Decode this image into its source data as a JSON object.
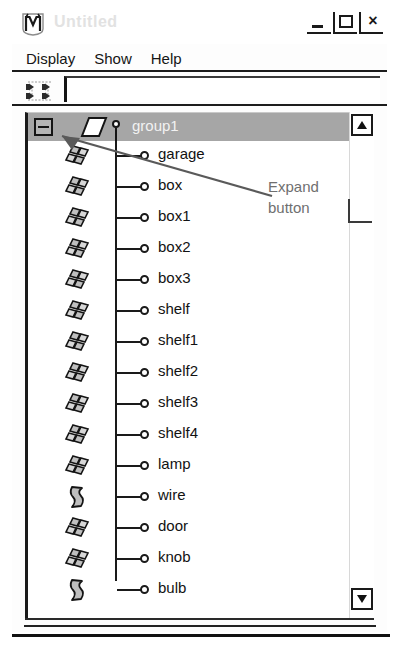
{
  "window": {
    "title": "Untitled",
    "app_icon": "m-logo-icon",
    "controls": [
      {
        "name": "minimize",
        "glyph": "_"
      },
      {
        "name": "maximize",
        "glyph": "square"
      },
      {
        "name": "close",
        "glyph": "×"
      }
    ]
  },
  "menu": {
    "items": [
      {
        "label": "Display"
      },
      {
        "label": "Show"
      },
      {
        "label": "Help"
      }
    ]
  },
  "toolbar": {
    "hierarchy_icon": "hierarchy-nodes-icon",
    "path_field": {
      "value": "",
      "placeholder": ""
    }
  },
  "tree": {
    "root": {
      "label": "group1",
      "icon": "plane-patch-icon",
      "selected": true,
      "expanded": true,
      "expand_button_glyph": "−"
    },
    "children": [
      {
        "label": "garage",
        "icon": "mesh-patch-icon"
      },
      {
        "label": "box",
        "icon": "mesh-patch-icon"
      },
      {
        "label": "box1",
        "icon": "mesh-patch-icon"
      },
      {
        "label": "box2",
        "icon": "mesh-patch-icon"
      },
      {
        "label": "box3",
        "icon": "mesh-patch-icon"
      },
      {
        "label": "shelf",
        "icon": "mesh-patch-icon"
      },
      {
        "label": "shelf1",
        "icon": "mesh-patch-icon"
      },
      {
        "label": "shelf2",
        "icon": "mesh-patch-icon"
      },
      {
        "label": "shelf3",
        "icon": "mesh-patch-icon"
      },
      {
        "label": "shelf4",
        "icon": "mesh-patch-icon"
      },
      {
        "label": "lamp",
        "icon": "mesh-patch-icon"
      },
      {
        "label": "wire",
        "icon": "curved-patch-icon"
      },
      {
        "label": "door",
        "icon": "mesh-patch-icon"
      },
      {
        "label": "knob",
        "icon": "mesh-patch-icon"
      },
      {
        "label": "bulb",
        "icon": "curved-patch-icon"
      }
    ]
  },
  "scrollbar": {
    "up_arrow": "scroll-up-arrow-icon",
    "down_arrow": "scroll-down-arrow-icon"
  },
  "annotation": {
    "line1": "Expand",
    "line2": "button"
  },
  "colors": {
    "selection": "#a6a6a6",
    "selection_text": "#f2f2f2",
    "annotation_text": "#6f6f6f",
    "line": "#1a1a1a",
    "background": "#ffffff"
  }
}
